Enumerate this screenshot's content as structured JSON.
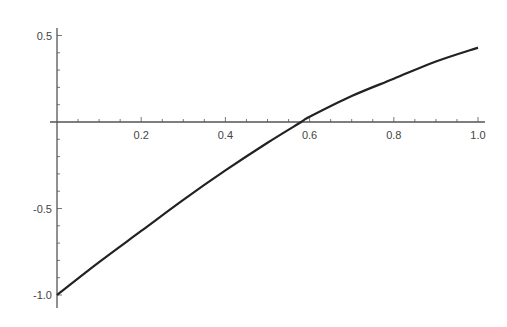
{
  "chart_data": {
    "type": "line",
    "title": "",
    "xlabel": "",
    "ylabel": "",
    "xlim": [
      0,
      1.0
    ],
    "ylim": [
      -1.05,
      0.52
    ],
    "grid": false,
    "legend": null,
    "x_ticks": [
      0.2,
      0.4,
      0.6,
      0.8,
      1.0
    ],
    "x_tick_labels": [
      "0.2",
      "0.4",
      "0.6",
      "0.8",
      "1.0"
    ],
    "y_ticks": [
      0.5,
      -0.5,
      -1.0
    ],
    "y_tick_labels": [
      "0.5",
      "-0.5",
      "-1.0"
    ],
    "series": [
      {
        "name": "f(x)",
        "color": "#222222",
        "x": [
          0,
          0.1,
          0.2,
          0.3,
          0.4,
          0.5,
          0.58,
          0.6,
          0.7,
          0.8,
          0.9,
          1.0
        ],
        "values": [
          -1.0,
          -0.81,
          -0.63,
          -0.45,
          -0.28,
          -0.12,
          0.0,
          0.03,
          0.15,
          0.25,
          0.35,
          0.43
        ]
      }
    ],
    "annotations": []
  },
  "axes": {
    "color": "#555555"
  }
}
